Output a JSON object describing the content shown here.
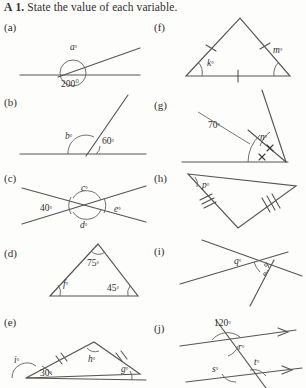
{
  "header": {
    "marker": "A",
    "number": "1.",
    "instruction": "State the value of each variable."
  },
  "parts": {
    "a": {
      "label": "(a)",
      "vars": [
        "a"
      ],
      "given": [
        "200°"
      ]
    },
    "b": {
      "label": "(b)",
      "vars": [
        "b"
      ],
      "given": [
        "60°"
      ]
    },
    "c": {
      "label": "(c)",
      "vars": [
        "c",
        "d",
        "e"
      ],
      "given": [
        "40°"
      ]
    },
    "d": {
      "label": "(d)",
      "vars": [
        "f"
      ],
      "given": [
        "75°",
        "45°"
      ]
    },
    "e": {
      "label": "(e)",
      "vars": [
        "h",
        "i",
        "g"
      ],
      "given": [
        "30°"
      ]
    },
    "f": {
      "label": "(f)",
      "vars": [
        "k",
        "m"
      ],
      "given": []
    },
    "g": {
      "label": "(g)",
      "vars": [
        "n"
      ],
      "given": [
        "70°"
      ]
    },
    "h": {
      "label": "(h)",
      "vars": [
        "p"
      ],
      "given": []
    },
    "i": {
      "label": "(i)",
      "vars": [
        "q"
      ],
      "given": []
    },
    "j": {
      "label": "(j)",
      "vars": [
        "r",
        "s",
        "t"
      ],
      "given": [
        "120°"
      ]
    }
  },
  "figures": {
    "a": {
      "angle_label": "a°",
      "reflex_label": "200°"
    },
    "b": {
      "left_label": "b°",
      "right_label": "60°"
    },
    "c": {
      "top_label": "c°",
      "left_label": "40°",
      "right_label": "e°",
      "bottom_label": "d°"
    },
    "d": {
      "apex_label": "75°",
      "left_label": "f°",
      "right_label": "45°"
    },
    "e": {
      "exterior_label": "i°",
      "base_label": "30°",
      "apex_label": "h°",
      "right_label": "g°"
    },
    "f": {
      "left_label": "k°",
      "exterior_label": "m°"
    },
    "g": {
      "given_label": "70°",
      "var_label": "n°"
    },
    "h": {
      "apex_label": "p°"
    },
    "i": {
      "var_label": "q°"
    },
    "j": {
      "given_label": "120°",
      "upper_label": "r°",
      "lower_left_label": "s°",
      "lower_right_label": "t°"
    }
  },
  "colors": {
    "ink": "#555555",
    "text": "#2e2e2e",
    "page": "#fdfdfb"
  }
}
